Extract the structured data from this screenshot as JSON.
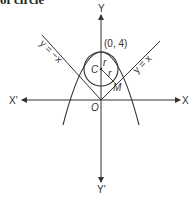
{
  "caption": "of circle",
  "diagram": {
    "axes": {
      "x_pos_label": "X",
      "x_neg_label": "X'",
      "y_pos_label": "Y",
      "y_neg_label": "Y'",
      "origin_label": "O"
    },
    "points": {
      "apex_label": "(0, 4)",
      "center_label": "C",
      "tangent_point_label": "M"
    },
    "radius_labels": [
      "r",
      "r"
    ],
    "lines": {
      "right_line_label": "y = x",
      "left_line_label": "y = −x"
    },
    "colors": {
      "stroke": "#333333",
      "background": "#ffffff"
    }
  }
}
